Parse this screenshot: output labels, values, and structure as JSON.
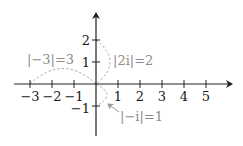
{
  "diagram": {
    "axes": {
      "x_ticks": [
        {
          "value": -3,
          "label": "−3"
        },
        {
          "value": -2,
          "label": "−2"
        },
        {
          "value": -1,
          "label": "−1"
        },
        {
          "value": 1,
          "label": "1"
        },
        {
          "value": 2,
          "label": "2"
        },
        {
          "value": 3,
          "label": "3"
        },
        {
          "value": 4,
          "label": "4"
        },
        {
          "value": 5,
          "label": "5"
        }
      ],
      "y_ticks": [
        {
          "value": 2,
          "label": "2"
        },
        {
          "value": 1,
          "label": "1"
        },
        {
          "value": -1,
          "label": "−1"
        }
      ],
      "axis_color": "#222222"
    },
    "annotations": [
      {
        "id": "neg3",
        "label": "|−3|=3",
        "from": [
          0,
          0
        ],
        "to": [
          -3,
          0
        ]
      },
      {
        "id": "2i",
        "label": "|2i|=2",
        "from": [
          0,
          0
        ],
        "to": [
          0,
          2
        ]
      },
      {
        "id": "negi",
        "label": "|−i|=1",
        "from": [
          0,
          0
        ],
        "to": [
          0,
          -1
        ]
      }
    ],
    "annotation_color": "#9a9a9a"
  }
}
